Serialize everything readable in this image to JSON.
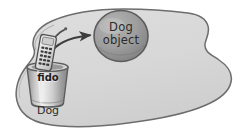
{
  "diagram": {
    "heap": {
      "name": "heap-blob",
      "fill": "#d9d9d9",
      "stroke": "#6e6e6e"
    },
    "object": {
      "label_line1": "Dog",
      "label_line2": "object",
      "fill": "#9c9c9c",
      "stroke": "#5a5a5a"
    },
    "reference": {
      "variable_name": "fido",
      "type_label": "Dog",
      "cup_fill": "#c9c9c9",
      "cup_stroke": "#5e5e5e"
    },
    "remote": {
      "name": "remote-control",
      "fill": "#e2e2e2",
      "stroke": "#4f4f4f",
      "button_color": "#3a3a3a"
    },
    "arrow": {
      "name": "reference-arrow",
      "color": "#3d3d3d"
    }
  }
}
